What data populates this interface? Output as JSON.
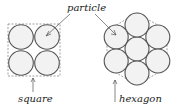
{
  "diagram": {
    "title": "",
    "labels": {
      "particle": "particle",
      "square": "square",
      "hexagon": "hexagon"
    },
    "arrangements": [
      {
        "name": "square",
        "particle_count": 4,
        "boundary_shape": "square",
        "boundary_style": "dashed"
      },
      {
        "name": "hexagon",
        "particle_count": 7,
        "boundary_shape": "hexagon",
        "boundary_style": "dashed"
      }
    ],
    "colors": {
      "particle_fill": "#f2f2f2",
      "particle_stroke": "#555555",
      "boundary": "#777777",
      "text": "#222222"
    }
  }
}
